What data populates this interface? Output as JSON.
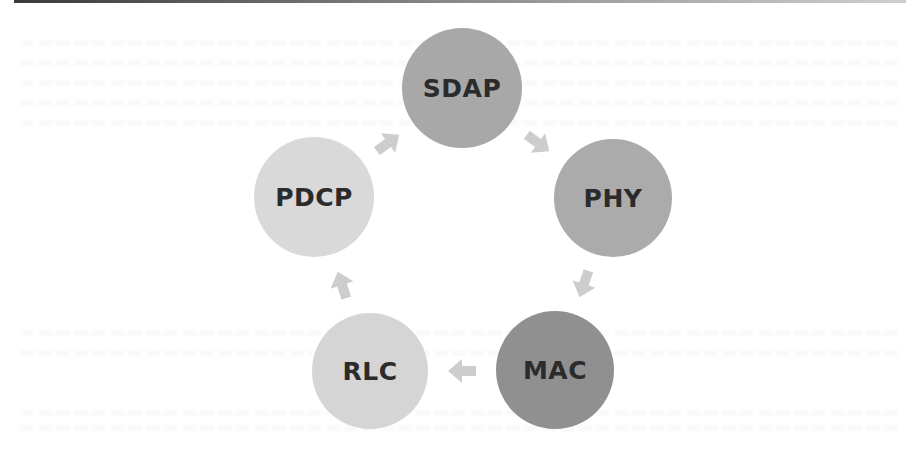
{
  "diagram": {
    "type": "cycle",
    "nodes": [
      {
        "id": "sdap",
        "label": "SDAP",
        "color": "#a8a8a8",
        "cx": 462,
        "cy": 88,
        "r": 60
      },
      {
        "id": "phy",
        "label": "PHY",
        "color": "#ababab",
        "cx": 613,
        "cy": 198,
        "r": 59
      },
      {
        "id": "mac",
        "label": "MAC",
        "color": "#909090",
        "cx": 555,
        "cy": 370,
        "r": 59
      },
      {
        "id": "rlc",
        "label": "RLC",
        "color": "#d5d5d5",
        "cx": 370,
        "cy": 371,
        "r": 58
      },
      {
        "id": "pdcp",
        "label": "PDCP",
        "color": "#d9d9d9",
        "cx": 314,
        "cy": 197,
        "r": 60
      }
    ],
    "edges": [
      {
        "from": "sdap",
        "to": "phy"
      },
      {
        "from": "phy",
        "to": "mac"
      },
      {
        "from": "mac",
        "to": "rlc"
      },
      {
        "from": "rlc",
        "to": "pdcp"
      },
      {
        "from": "pdcp",
        "to": "sdap"
      }
    ],
    "arrow_color": "#cdcdcd",
    "label_color": "#2b2b2b"
  }
}
